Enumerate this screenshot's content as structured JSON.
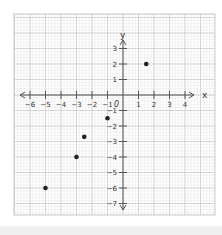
{
  "chart_data": {
    "type": "scatter",
    "title": "",
    "xlabel": "x",
    "ylabel": "y",
    "origin_label": "0",
    "xlim": [
      -6,
      4
    ],
    "ylim": [
      -7,
      3
    ],
    "x_ticks": [
      -6,
      -5,
      -4,
      -3,
      -2,
      -1,
      1,
      2,
      3,
      4
    ],
    "y_ticks": [
      3,
      2,
      1,
      -1,
      -2,
      -3,
      -4,
      -5,
      -6,
      -7
    ],
    "grid": true,
    "legend": null,
    "points": [
      {
        "x": 1.5,
        "y": 2
      },
      {
        "x": -1,
        "y": -1.5
      },
      {
        "x": -2.5,
        "y": -2.7
      },
      {
        "x": -3,
        "y": -4
      },
      {
        "x": -5,
        "y": -6
      }
    ]
  },
  "colors": {
    "minor_grid": "#e6e6e6",
    "major_grid": "#c8c8c8",
    "axis": "#555555",
    "point": "#222222",
    "label": "#333333"
  }
}
